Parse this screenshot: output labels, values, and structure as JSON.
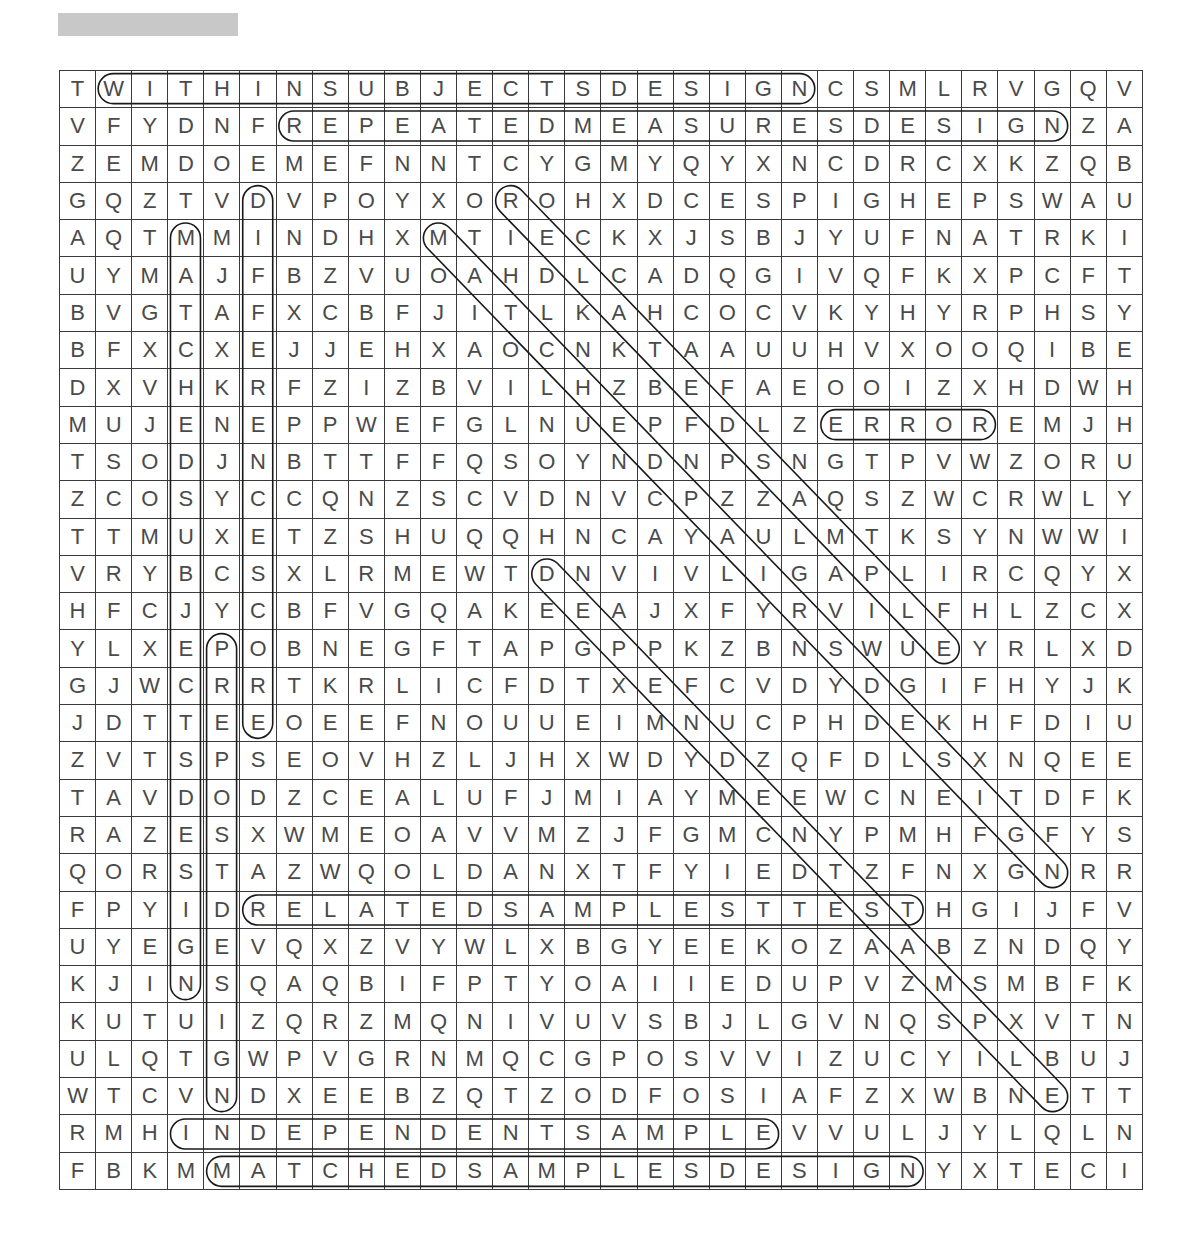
{
  "header": {
    "title_placeholder_color": "#c8c8c8"
  },
  "puzzle": {
    "rows": 30,
    "cols": 30,
    "grid": [
      "TWITHINSUBJECTSDESIGNCSMLRVGQV",
      "VFYDNFREPEATEDMEASURESDESIGNZA",
      "ZEMDOEMEFNNTCYGMYQYXNCDRCXKZQB",
      "GQZTVDVPOYXOROHXDCESPIGHEPSWAU",
      "AQTMMINDHXMTIECKXJSBJYUFNATRKI",
      "UYMAJFBZVUOAHDLCADQGIVQFKXPCFT",
      "BVGTAFXCBFJITLKAHCOCVKYHYRPHSY",
      "BFXCXEJJEHXAOCNKTAAUUHVXOOQIBE",
      "DXVHKRFZIZBVILHZBEFAEOOIZXHDWH",
      "MUJENEPPWEFGLNUEPFDLZERROREMJH",
      "TSODJNBTTFFQSOYNDNPSNGTPVWZORU",
      "ZCOSYCCQNZSCVDNVCPZZAQSZWCRWLY",
      "TTMUXETZSHUQQHNCAYAULMTKSYNWWI",
      "VRYBCSXLRMEWTDNVIVLIGAPLIRCQYX",
      "HFCJYCBFVGQAKEEAJXFYRVILFHLZCX",
      "YLXEPOBNEGFTAPGPPKZBNSWUEYRLXD",
      "GJWCRRTKRLICFDTXEFCVDYDGIFHYJK",
      "JDTTEEOEEFNOUUEIMNUCPHDEKHFDIU",
      "ZVTSPSEOVHZLJHXWDYDZQFDLSXNQEE",
      "TAVDODZCEALUFJMIAYMEEWCNEITDFK",
      "RAZESXWMEOAVVMZJFGMCNYPMHFGFYS",
      "QORSTAZWQOLDANXTFYIEDTZFNXGNRR",
      "FPYIDRELATEDSAMPLESTTESTHGIJFV",
      "UYEGEVQXZVYWLXBGYEEKOZAABZNDQY",
      "KJINSQAQBIFPTYOAIIEDUPVZMSMBFK",
      "KUTUIZQRZMQNIVUVSBJLGVNQSPXVTN",
      "ULQTGWPVGRNMQCGPOSVVIZUCYILBUJ",
      "WTCVNDXEEBZQTZODFOSIAFZXWBNETT",
      "RMHINDEPENDENTSAMPLEVVULJYLQLN",
      "FBKMMATCHEDSAMPLESDESIGNYXTECI"
    ],
    "found_words": [
      {
        "word": "WITHINSUBJECTSDESIGN",
        "dir": "horizontal",
        "start": [
          1,
          2
        ],
        "end": [
          1,
          21
        ]
      },
      {
        "word": "REPEATEDMEASURESDESIGN",
        "dir": "horizontal",
        "start": [
          2,
          7
        ],
        "end": [
          2,
          28
        ]
      },
      {
        "word": "ERROR",
        "dir": "horizontal",
        "start": [
          10,
          22
        ],
        "end": [
          10,
          26
        ]
      },
      {
        "word": "RELATEDSAMPLESTTEST",
        "dir": "horizontal",
        "start": [
          23,
          6
        ],
        "end": [
          23,
          24
        ]
      },
      {
        "word": "INDEPENDENTSAMPLE",
        "dir": "horizontal",
        "start": [
          29,
          4
        ],
        "end": [
          29,
          20
        ]
      },
      {
        "word": "MATCHEDSAMPLESDESIGN",
        "dir": "horizontal",
        "start": [
          30,
          5
        ],
        "end": [
          30,
          24
        ]
      },
      {
        "word": "MATCHEDSUBJECTSDESIGN",
        "dir": "vertical",
        "start": [
          5,
          4
        ],
        "end": [
          25,
          4
        ]
      },
      {
        "word": "DIFFERENCESCORE",
        "dir": "vertical",
        "start": [
          4,
          6
        ],
        "end": [
          18,
          6
        ]
      },
      {
        "word": "PREPOSTDESIGN",
        "dir": "vertical",
        "start": [
          16,
          5
        ],
        "end": [
          28,
          5
        ]
      },
      {
        "word": "RELATEDSAMPLE",
        "dir": "diagonal",
        "start": [
          4,
          13
        ],
        "end": [
          16,
          25
        ]
      },
      {
        "word": "MATCHEDPAIRSDESIGN",
        "dir": "diagonal",
        "start": [
          5,
          11
        ],
        "end": [
          22,
          28
        ]
      },
      {
        "word": "DEPENDENTSAMPLE",
        "dir": "diagonal",
        "start": [
          14,
          14
        ],
        "end": [
          28,
          28
        ]
      }
    ]
  }
}
